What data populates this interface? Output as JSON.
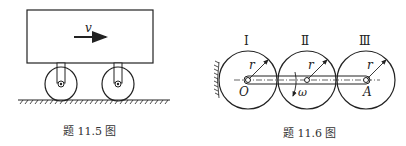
{
  "figure_left": {
    "caption": "题 11.5 图",
    "velocity_label": "v",
    "parts": [
      "cart-body",
      "velocity-arrow",
      "wheel-left",
      "wheel-right",
      "ground"
    ]
  },
  "figure_right": {
    "caption": "题 11.6 图",
    "gears": [
      {
        "numeral": "Ⅰ",
        "radius_label": "r",
        "center_label": "O"
      },
      {
        "numeral": "Ⅱ",
        "radius_label": "r",
        "center_label": ""
      },
      {
        "numeral": "Ⅲ",
        "radius_label": "r",
        "center_label": "A"
      }
    ],
    "angular_velocity_label": "ω"
  },
  "colors": {
    "line": "#222222",
    "background": "#ffffff"
  }
}
